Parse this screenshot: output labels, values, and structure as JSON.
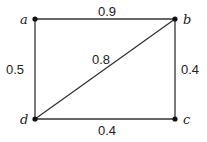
{
  "graph": {
    "nodes": [
      {
        "id": "a",
        "label": "a",
        "x": 35,
        "y": 19
      },
      {
        "id": "b",
        "label": "b",
        "x": 175,
        "y": 19
      },
      {
        "id": "c",
        "label": "c",
        "x": 175,
        "y": 119
      },
      {
        "id": "d",
        "label": "d",
        "x": 35,
        "y": 119
      }
    ],
    "edges": [
      {
        "from": "a",
        "to": "b",
        "weight": "0.9"
      },
      {
        "from": "a",
        "to": "d",
        "weight": "0.5"
      },
      {
        "from": "b",
        "to": "c",
        "weight": "0.4"
      },
      {
        "from": "d",
        "to": "c",
        "weight": "0.4"
      },
      {
        "from": "d",
        "to": "b",
        "weight": "0.8"
      }
    ]
  },
  "labels": {
    "node_a": "a",
    "node_b": "b",
    "node_c": "c",
    "node_d": "d",
    "edge_ab": "0.9",
    "edge_ad": "0.5",
    "edge_bc": "0.4",
    "edge_dc": "0.4",
    "edge_db": "0.8"
  }
}
